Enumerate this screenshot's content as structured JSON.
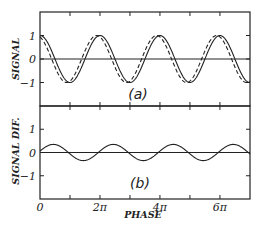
{
  "chart_data": [
    {
      "type": "line",
      "panel_label": "(a)",
      "ylabel": "SIGNAL",
      "xlabel": "",
      "xlim": [
        0,
        22.0
      ],
      "ylim": [
        -2,
        2
      ],
      "yticks": [
        {
          "value": 1,
          "label": "1"
        },
        {
          "value": 0,
          "label": "0"
        },
        {
          "value": -1,
          "label": "-1"
        }
      ],
      "series": [
        {
          "name": "signal",
          "style": "solid",
          "function": "cos(x)",
          "amplitude": 1,
          "phase_shift": 0
        },
        {
          "name": "shifted signal",
          "style": "dashed",
          "function": "cos(x + 0.35)",
          "amplitude": 1,
          "phase_shift": 0.35
        }
      ],
      "reference_line": {
        "y": 0
      }
    },
    {
      "type": "line",
      "panel_label": "(b)",
      "ylabel": "SIGNAL DIF.",
      "xlabel": "PHASE",
      "xlim": [
        0,
        22.0
      ],
      "ylim": [
        -2,
        2
      ],
      "yticks": [
        {
          "value": 1,
          "label": "1"
        },
        {
          "value": 0,
          "label": "0"
        },
        {
          "value": -1,
          "label": "-1"
        }
      ],
      "xticks": [
        {
          "value": 0,
          "label": "0"
        },
        {
          "value": 6.2832,
          "label": "2π"
        },
        {
          "value": 12.5664,
          "label": "4π"
        },
        {
          "value": 18.8496,
          "label": "6π"
        }
      ],
      "minor_xticks": [
        3.1416,
        9.4248,
        15.708
      ],
      "series": [
        {
          "name": "signal difference",
          "style": "solid",
          "function": "cos(x) - cos(x + 0.35)",
          "amplitude": 0.34
        }
      ],
      "reference_line": {
        "y": 0
      }
    }
  ]
}
